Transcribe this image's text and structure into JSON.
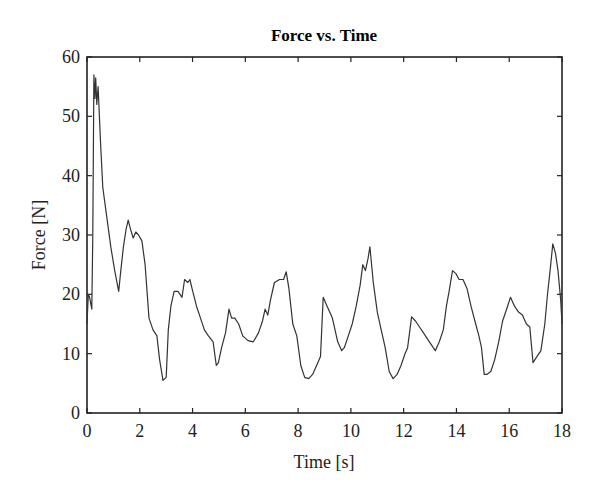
{
  "chart_data": {
    "type": "line",
    "title": "Force vs. Time",
    "xlabel": "Time [s]",
    "ylabel": "Force [N]",
    "xlim": [
      0,
      18
    ],
    "ylim": [
      0,
      60
    ],
    "xticks": [
      0,
      2,
      4,
      6,
      8,
      10,
      12,
      14,
      16,
      18
    ],
    "yticks": [
      0,
      10,
      20,
      30,
      40,
      50,
      60
    ],
    "grid": false,
    "legend": null,
    "line_color": "#333333",
    "series": [
      {
        "name": "Force",
        "x": [
          0.0,
          0.05,
          0.1,
          0.18,
          0.22,
          0.26,
          0.3,
          0.33,
          0.37,
          0.42,
          0.47,
          0.52,
          0.6,
          0.75,
          0.9,
          1.05,
          1.2,
          1.28,
          1.38,
          1.48,
          1.56,
          1.65,
          1.75,
          1.85,
          1.95,
          2.08,
          2.2,
          2.35,
          2.5,
          2.65,
          2.75,
          2.88,
          3.0,
          3.08,
          3.18,
          3.3,
          3.45,
          3.6,
          3.7,
          3.82,
          3.9,
          3.98,
          4.15,
          4.3,
          4.45,
          4.6,
          4.78,
          4.9,
          4.98,
          5.1,
          5.25,
          5.38,
          5.48,
          5.6,
          5.75,
          5.9,
          6.1,
          6.3,
          6.5,
          6.65,
          6.75,
          6.85,
          6.95,
          7.1,
          7.3,
          7.45,
          7.55,
          7.65,
          7.8,
          7.95,
          8.1,
          8.25,
          8.4,
          8.55,
          8.7,
          8.85,
          8.95,
          9.1,
          9.3,
          9.5,
          9.65,
          9.75,
          9.9,
          10.05,
          10.2,
          10.35,
          10.45,
          10.55,
          10.65,
          10.72,
          10.85,
          11.0,
          11.15,
          11.3,
          11.45,
          11.6,
          11.75,
          11.9,
          12.05,
          12.15,
          12.3,
          12.45,
          12.6,
          12.75,
          12.9,
          13.05,
          13.2,
          13.35,
          13.5,
          13.62,
          13.72,
          13.85,
          13.98,
          14.1,
          14.25,
          14.4,
          14.55,
          14.7,
          14.85,
          14.95,
          15.05,
          15.15,
          15.3,
          15.45,
          15.6,
          15.75,
          15.9,
          16.05,
          16.2,
          16.35,
          16.5,
          16.65,
          16.78,
          16.9,
          17.05,
          17.2,
          17.35,
          17.45,
          17.55,
          17.65,
          17.75,
          17.85,
          17.95,
          18.0
        ],
        "y": [
          15,
          20,
          19.5,
          17.5,
          30,
          57,
          53,
          56.5,
          52,
          55,
          50,
          45,
          38,
          33,
          28,
          24,
          20.5,
          24,
          28,
          31,
          32.5,
          31,
          29.5,
          30.5,
          30,
          29,
          25,
          16,
          14,
          13,
          9,
          5.5,
          6,
          14,
          18,
          20.5,
          20.5,
          19.5,
          22.5,
          22,
          22.5,
          21,
          18,
          16,
          14,
          13,
          12,
          8,
          8.5,
          11,
          13.5,
          17.5,
          16,
          16,
          15,
          13,
          12.2,
          12,
          13.5,
          15.5,
          17.5,
          16.5,
          19,
          22,
          22.5,
          22.5,
          23.8,
          21,
          15,
          13,
          8,
          6,
          5.8,
          6.5,
          8,
          9.5,
          19.5,
          18,
          16,
          12,
          10.5,
          11,
          13,
          15,
          18,
          21.5,
          25,
          24,
          26,
          28,
          22,
          17,
          14,
          11,
          7,
          5.8,
          6.5,
          8,
          10,
          11,
          16.2,
          15.5,
          14.5,
          13.5,
          12.5,
          11.5,
          10.5,
          12,
          14,
          18,
          20.5,
          24,
          23.5,
          22.5,
          22.5,
          21,
          18,
          15.5,
          13,
          11,
          6.5,
          6.5,
          7,
          9,
          12,
          15.5,
          17.5,
          19.5,
          18,
          17,
          16.5,
          15,
          14.5,
          8.5,
          9.5,
          10.5,
          15,
          20,
          24,
          28.5,
          27,
          24,
          19,
          15
        ]
      }
    ]
  }
}
